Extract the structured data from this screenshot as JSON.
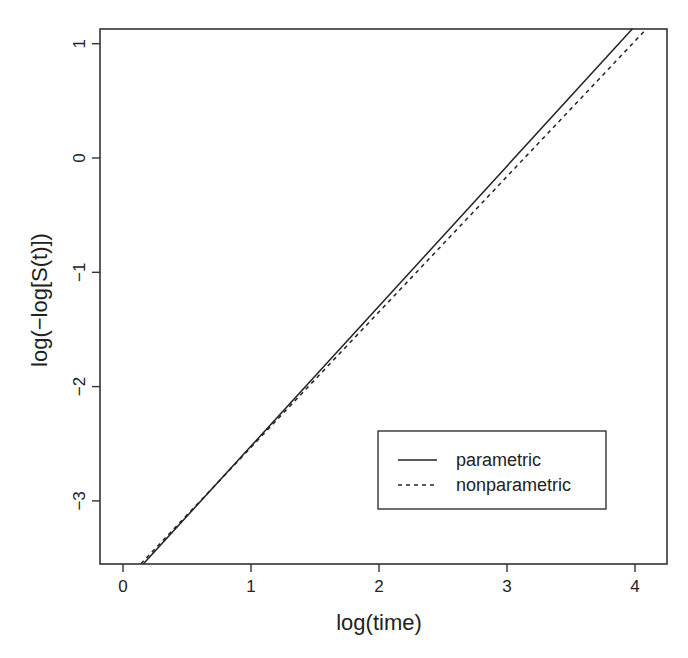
{
  "chart_data": {
    "type": "line",
    "title": "",
    "xlabel": "log(time)",
    "ylabel": "log(−log[S(t)])",
    "xlim": [
      -0.2,
      4.25
    ],
    "ylim": [
      -3.55,
      1.13
    ],
    "xticks": [
      0,
      1,
      2,
      3,
      4
    ],
    "xtick_labels": [
      "0",
      "1",
      "2",
      "3",
      "4"
    ],
    "yticks": [
      -3,
      -2,
      -1,
      0,
      1
    ],
    "ytick_labels": [
      "−3",
      "−2",
      "−1",
      "0",
      "1"
    ],
    "grid": false,
    "legend_position": "bottom-right (inside)",
    "series": [
      {
        "name": "parametric",
        "style": "solid",
        "x": [
          0.16,
          3.98
        ],
        "y": [
          -3.55,
          1.13
        ]
      },
      {
        "name": "nonparametric",
        "style": "dashed",
        "x": [
          0.14,
          4.09
        ],
        "y": [
          -3.55,
          1.13
        ]
      }
    ]
  },
  "legend": {
    "items": [
      {
        "label": "parametric",
        "style": "solid"
      },
      {
        "label": "nonparametric",
        "style": "dashed"
      }
    ]
  },
  "axes": {
    "x_title": "log(time)",
    "y_title": "log(−log[S(t)])"
  }
}
